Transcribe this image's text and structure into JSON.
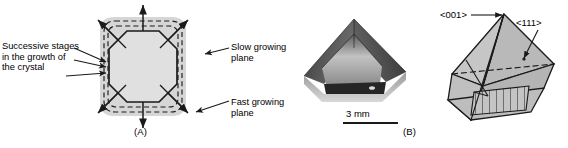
{
  "figure": {
    "panel_a": {
      "label": "(A)",
      "annotations": {
        "successive_line1": "Successive stages",
        "successive_line2": "in the growth of",
        "successive_line3": "the crystal",
        "slow_line1": "Slow growing",
        "slow_line2": "plane",
        "fast_line1": "Fast growing",
        "fast_line2": "plane"
      },
      "icons": {
        "leader_arrow": "arrow-icon",
        "growth_arrow": "growth-direction-arrow-icon"
      },
      "colors": {
        "fill_outer": "#d4d4d4",
        "fill_inner": "#dcdcdc",
        "stroke": "#1a1a1a"
      }
    },
    "panel_b": {
      "label": "(B)",
      "scale_value": "3 mm",
      "icons": {
        "crystal_photo": "crystal-photograph-icon",
        "scale_bar": "scale-bar-icon"
      }
    },
    "panel_c": {
      "direction_001": "<001>",
      "direction_111": "<111>",
      "icons": {
        "pointer_001": "leader-arrow-icon",
        "pointer_111": "leader-arrow-icon",
        "crystal_habit": "crystal-habit-diagram-icon"
      },
      "colors": {
        "face_light": "#c9c9c9",
        "face_mid": "#b8b8b8",
        "face_dark": "#a8a8a8",
        "stroke": "#1a1a1a"
      }
    }
  }
}
